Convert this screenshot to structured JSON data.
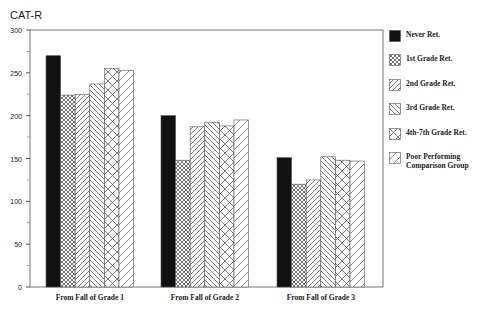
{
  "chart_data": {
    "type": "bar",
    "title": "",
    "ylabel": "CAT-R",
    "xlabel": "",
    "ylim": [
      0,
      300
    ],
    "yticks": [
      0,
      50,
      100,
      150,
      200,
      250,
      300
    ],
    "grid": false,
    "legend_position": "right",
    "categories": [
      "From Fall of Grade 1",
      "From Fall of Grade 2",
      "From Fall of Grade 3"
    ],
    "series": [
      {
        "name": "Never Ret.",
        "pattern": "solid-black",
        "values": [
          270,
          200,
          151
        ]
      },
      {
        "name": "1st Grade Ret.",
        "pattern": "crosshatch-fine",
        "values": [
          224,
          148,
          120
        ]
      },
      {
        "name": "2nd Grade Ret.",
        "pattern": "diagonal-forward",
        "values": [
          225,
          187,
          125
        ]
      },
      {
        "name": "3rd Grade Ret.",
        "pattern": "diagonal-backward",
        "values": [
          237,
          192,
          152
        ]
      },
      {
        "name": "4th-7th Grade Ret.",
        "pattern": "crosshatch-diamond",
        "values": [
          255,
          188,
          148
        ]
      },
      {
        "name": "Poor Performing Comparison Group",
        "pattern": "diagonal-forward-wide",
        "values": [
          253,
          195,
          147
        ]
      }
    ]
  },
  "axis": {
    "y_title": "CAT-R",
    "y_tick_labels": [
      "0",
      "50",
      "100",
      "150",
      "200",
      "250",
      "300"
    ]
  },
  "legend": [
    {
      "label": "Never Ret."
    },
    {
      "label": "1st Grade Ret."
    },
    {
      "label": "2nd Grade Ret."
    },
    {
      "label": "3rd Grade Ret."
    },
    {
      "label": "4th-7th Grade Ret."
    },
    {
      "label": "Poor Performing",
      "label2": "Comparison Group"
    }
  ]
}
